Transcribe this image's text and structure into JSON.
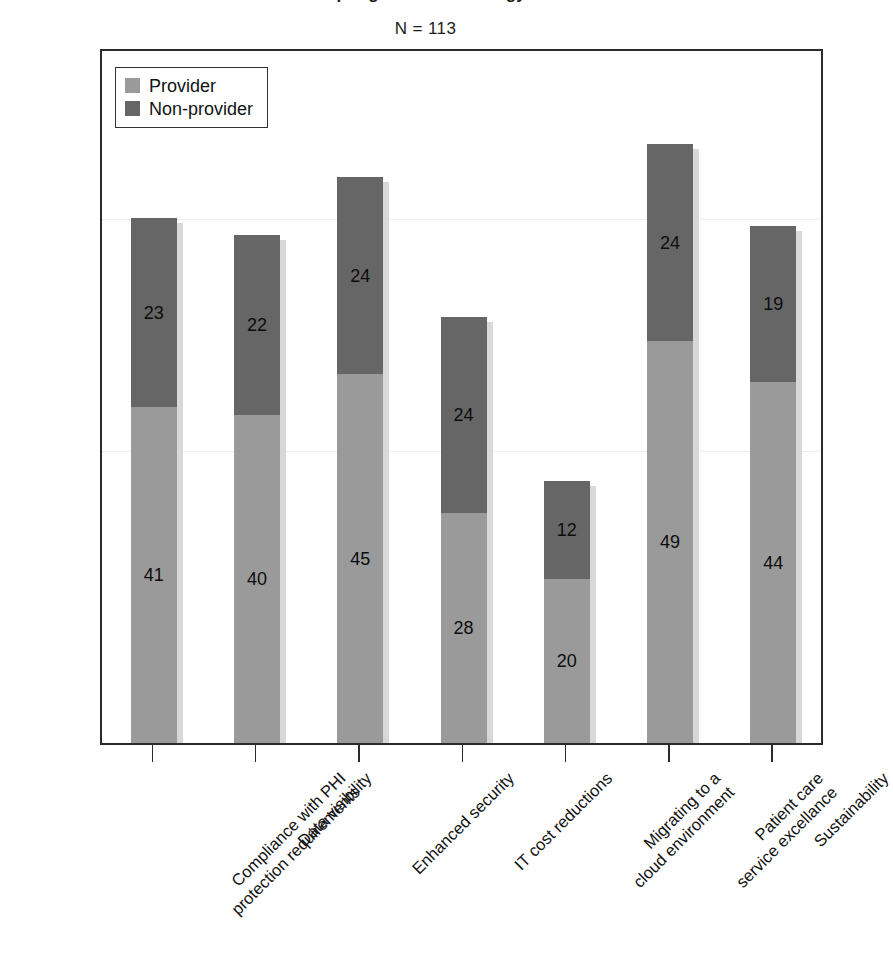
{
  "chart": {
    "title": "Drivers for adopting cloud technology in healthcare",
    "subtitle": "N = 113"
  },
  "legend": {
    "position": "top-left-inside",
    "items": [
      {
        "label": "Provider",
        "color": "#9a9a9a",
        "icon": "legend-swatch-icon"
      },
      {
        "label": "Non-provider",
        "color": "#666666",
        "icon": "legend-swatch-icon"
      }
    ]
  },
  "chart_data": {
    "type": "bar",
    "subtype": "stacked-vertical",
    "title": "Drivers for adopting cloud technology in healthcare",
    "subtitle": "N = 113",
    "xlabel": "",
    "ylabel": "",
    "ylim": [
      0,
      75
    ],
    "grid": false,
    "axis_tick_labels": [],
    "legend_position": "top-left-inside",
    "categories": [
      "Compliance with PHI\nprotection requirements",
      "Data visibility",
      "Enhanced security",
      "IT cost reductions",
      "Migrating to a\ncloud environment",
      "Patient care\nservice excellance",
      "Sustainability"
    ],
    "category_lines": [
      [
        "Compliance with PHI",
        "protection requirements"
      ],
      [
        "Data visibility"
      ],
      [
        "Enhanced security"
      ],
      [
        "IT cost reductions"
      ],
      [
        "Migrating to a",
        "cloud environment"
      ],
      [
        "Patient care",
        "service excellance"
      ],
      [
        "Sustainability"
      ]
    ],
    "series": [
      {
        "name": "Provider",
        "color": "#9a9a9a",
        "values": [
          41,
          40,
          45,
          28,
          20,
          49,
          44
        ]
      },
      {
        "name": "Non-provider",
        "color": "#666666",
        "values": [
          23,
          22,
          24,
          24,
          12,
          24,
          19
        ]
      }
    ],
    "totals": [
      64,
      62,
      69,
      52,
      32,
      73,
      63
    ],
    "data_labels": [
      {
        "category": "Compliance with PHI protection requirements",
        "provider": "41",
        "non_provider": "23"
      },
      {
        "category": "Data visibility",
        "provider": "40",
        "non_provider": "22"
      },
      {
        "category": "Enhanced security",
        "provider": "45",
        "non_provider": "24"
      },
      {
        "category": "IT cost reductions",
        "provider": "28",
        "non_provider": "24"
      },
      {
        "category": "Migrating to a cloud environment",
        "provider": "20",
        "non_provider": "12"
      },
      {
        "category": "Patient care service excellance",
        "provider": "49",
        "non_provider": "24"
      },
      {
        "category": "Sustainability",
        "provider": "44",
        "non_provider": "19"
      }
    ]
  }
}
